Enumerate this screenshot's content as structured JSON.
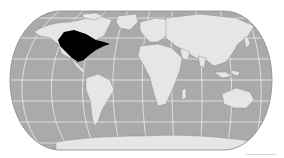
{
  "map": {
    "projection": "robinson",
    "colors": {
      "background": "#ffffff",
      "ocean": "#aaaaaa",
      "land": "#e6e6e6",
      "land_border": "#8c8c8c",
      "graticule": "#ededed",
      "outline": "#8a8a8a",
      "highlight": "#000000"
    },
    "highlighted_region": {
      "name": "Eastern North America",
      "fill": "#000000"
    },
    "regions": [
      {
        "name": "North America"
      },
      {
        "name": "Greenland"
      },
      {
        "name": "South America"
      },
      {
        "name": "Europe"
      },
      {
        "name": "Africa"
      },
      {
        "name": "Asia"
      },
      {
        "name": "Australia"
      },
      {
        "name": "Antarctica"
      }
    ]
  }
}
